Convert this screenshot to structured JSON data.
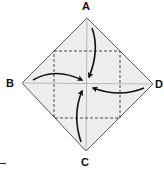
{
  "diagram": {
    "type": "origami-blintz-fold",
    "labels": {
      "top": "A",
      "left": "B",
      "right": "D",
      "bottom": "C"
    },
    "colors": {
      "paper_fill": "#ededed",
      "outline": "#555555",
      "crease": "#aaaaaa",
      "dashed_fold_line": "#333333",
      "arrow": "#111111"
    },
    "folds": [
      {
        "from": "A",
        "to": "center",
        "direction": "down"
      },
      {
        "from": "B",
        "to": "center",
        "direction": "right"
      },
      {
        "from": "D",
        "to": "center",
        "direction": "left"
      },
      {
        "from": "C",
        "to": "center",
        "direction": "up"
      }
    ]
  }
}
